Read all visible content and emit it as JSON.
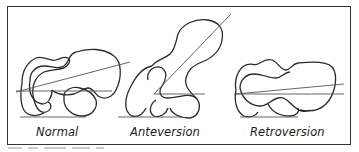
{
  "figure": {
    "panels": [
      {
        "id": "normal",
        "label": "Normal"
      },
      {
        "id": "anteversion",
        "label": "Anteversion"
      },
      {
        "id": "retroversion",
        "label": "Retroversion"
      }
    ],
    "colors": {
      "outline": "#2a2a2a",
      "axis_line": "#555555",
      "frame": "#333333"
    }
  }
}
